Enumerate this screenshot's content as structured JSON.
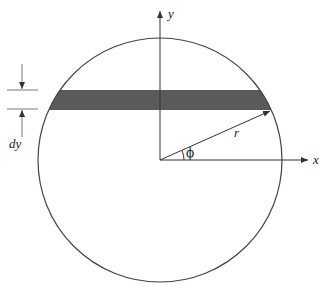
{
  "diagram": {
    "labels": {
      "x_axis": "x",
      "y_axis": "y",
      "radius": "r",
      "angle": "ϕ",
      "strip_thickness": "dy"
    },
    "colors": {
      "line": "#333333",
      "strip_fill": "#5a5a5a",
      "background": "#ffffff"
    },
    "geometry": {
      "center": [
        160,
        160
      ],
      "radius": 122,
      "strip_top_y": 90,
      "strip_bottom_y": 110,
      "radius_endpoint": [
        270,
        110
      ]
    }
  }
}
